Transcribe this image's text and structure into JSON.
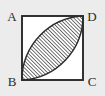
{
  "figure": {
    "shape_type": "geometric-diagram",
    "background_color": "#ececec",
    "inner_fill_color": "#ffffff",
    "stroke_color": "#2b2b2b",
    "hatch_color": "#2b2b2b",
    "square": {
      "name": "square-ABCD",
      "x": 22,
      "y": 16,
      "width": 61,
      "height": 64,
      "stroke_width": 1.6
    },
    "lens": {
      "name": "hatched-lens-BD",
      "description": "vesica piscis formed by two circular arcs joining B and D",
      "start_x": 22,
      "start_y": 80,
      "end_x": 83,
      "end_y": 16,
      "arc_radius": 64,
      "hatch_angle_deg": 45,
      "hatch_spacing": 2.6,
      "hatch_line_width": 1.3
    },
    "labels": {
      "a": "A",
      "b": "B",
      "c": "C",
      "d": "D"
    },
    "label_positions": {
      "a": {
        "x": 12,
        "y": 21
      },
      "b": {
        "x": 12,
        "y": 85
      },
      "c": {
        "x": 91,
        "y": 85
      },
      "d": {
        "x": 91,
        "y": 21
      }
    }
  }
}
